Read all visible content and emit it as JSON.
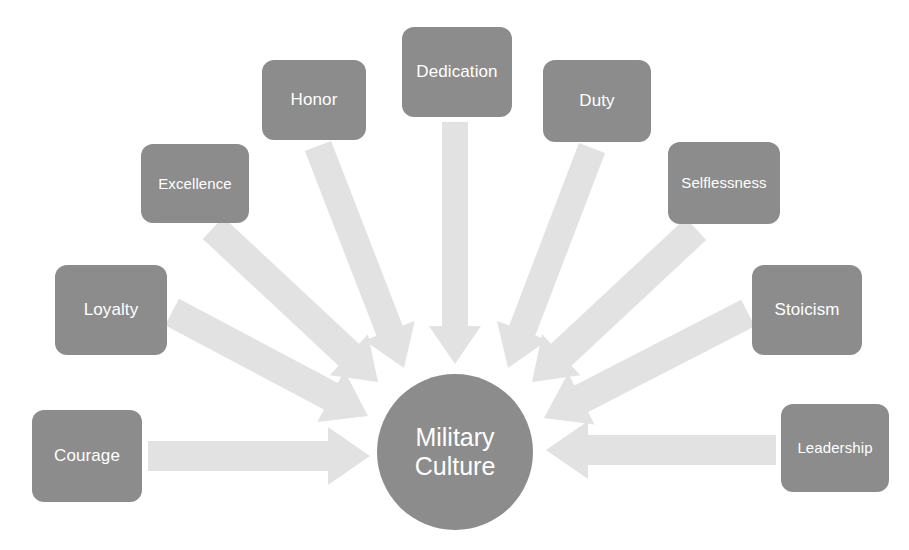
{
  "diagram": {
    "type": "radial-converging-arrows",
    "title": "Military Culture",
    "center": {
      "label_line1": "Military",
      "label_line2": "Culture",
      "shape": "circle",
      "fill": "#8c8c8c",
      "text_color": "#ffffff",
      "cx": 455,
      "cy": 452,
      "r": 78
    },
    "style": {
      "background": "#ffffff",
      "node_fill": "#8c8c8c",
      "node_text_color": "#ffffff",
      "arrow_fill": "#e2e2e2",
      "node_corner_radius": 12
    },
    "nodes": [
      {
        "id": "courage",
        "label": "Courage",
        "x": 32,
        "y": 410,
        "w": 110,
        "h": 92,
        "arrow": {
          "from_x": 148,
          "from_y": 456,
          "to_x": 370,
          "to_y": 456,
          "shaft": 30,
          "head_w": 58,
          "head_len": 42
        }
      },
      {
        "id": "loyalty",
        "label": "Loyalty",
        "x": 55,
        "y": 265,
        "w": 112,
        "h": 90,
        "arrow": {
          "from_x": 172,
          "from_y": 312,
          "to_x": 368,
          "to_y": 416,
          "shaft": 30,
          "head_w": 58,
          "head_len": 42
        }
      },
      {
        "id": "excellence",
        "label": "Excellence",
        "x": 141,
        "y": 144,
        "w": 108,
        "h": 79,
        "arrow": {
          "from_x": 213,
          "from_y": 228,
          "to_x": 378,
          "to_y": 382,
          "shaft": 30,
          "head_w": 56,
          "head_len": 40
        }
      },
      {
        "id": "honor",
        "label": "Honor",
        "x": 262,
        "y": 60,
        "w": 104,
        "h": 80,
        "arrow": {
          "from_x": 318,
          "from_y": 146,
          "to_x": 404,
          "to_y": 368,
          "shaft": 28,
          "head_w": 54,
          "head_len": 40
        }
      },
      {
        "id": "dedication",
        "label": "Dedication",
        "x": 402,
        "y": 27,
        "w": 110,
        "h": 90,
        "arrow": {
          "from_x": 455,
          "from_y": 122,
          "to_x": 455,
          "to_y": 364,
          "shaft": 26,
          "head_w": 52,
          "head_len": 38
        }
      },
      {
        "id": "duty",
        "label": "Duty",
        "x": 543,
        "y": 60,
        "w": 108,
        "h": 82,
        "arrow": {
          "from_x": 592,
          "from_y": 148,
          "to_x": 508,
          "to_y": 368,
          "shaft": 28,
          "head_w": 54,
          "head_len": 40
        }
      },
      {
        "id": "selflessness",
        "label": "Selflessness",
        "x": 668,
        "y": 142,
        "w": 112,
        "h": 82,
        "arrow": {
          "from_x": 696,
          "from_y": 229,
          "to_x": 532,
          "to_y": 382,
          "shaft": 30,
          "head_w": 56,
          "head_len": 40
        }
      },
      {
        "id": "stoicism",
        "label": "Stoicism",
        "x": 752,
        "y": 265,
        "w": 110,
        "h": 90,
        "arrow": {
          "from_x": 748,
          "from_y": 313,
          "to_x": 544,
          "to_y": 418,
          "shaft": 30,
          "head_w": 58,
          "head_len": 42
        }
      },
      {
        "id": "leadership",
        "label": "Leadership",
        "x": 781,
        "y": 404,
        "w": 108,
        "h": 88,
        "arrow": {
          "from_x": 776,
          "from_y": 450,
          "to_x": 546,
          "to_y": 450,
          "shaft": 30,
          "head_w": 58,
          "head_len": 42
        }
      }
    ]
  }
}
